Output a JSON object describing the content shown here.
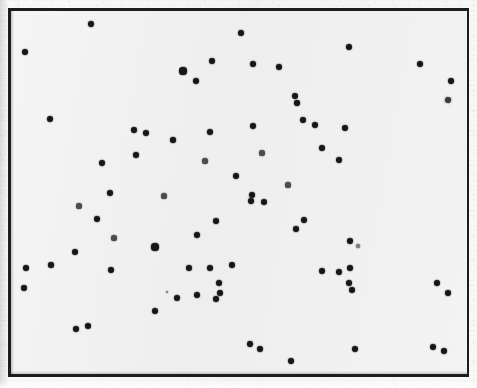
{
  "figure": {
    "kind": "scatter-plot-scan",
    "width": 477,
    "height": 388,
    "background_color": "#f2f2f2",
    "paper_color": "#f7f7f7",
    "frame": {
      "color": "#1d1d1d",
      "x": 8,
      "y": 8,
      "width": 461,
      "height": 369,
      "border_width": 2
    },
    "marker": {
      "color": "#161616",
      "shape": "circle",
      "size": 4
    }
  },
  "chart_data": {
    "type": "scatter",
    "title": "",
    "subtitle": "",
    "xlabel": "",
    "ylabel": "",
    "grid": false,
    "legend": null,
    "axis_ticks": [],
    "tick_labels": [],
    "annotations": [],
    "xlim": [
      0,
      477
    ],
    "ylim": [
      388,
      0
    ],
    "n_points": 74,
    "note": "Unlabeled scatter of dark round markers inside a rectangular frame; photocopied/scanned appearance, no axes ticks or text.",
    "series": [
      {
        "name": "points",
        "color": "#161616",
        "points": [
          {
            "x": 91,
            "y": 24,
            "r": 3.2
          },
          {
            "x": 25,
            "y": 52,
            "r": 3.0
          },
          {
            "x": 212,
            "y": 61,
            "r": 3.2
          },
          {
            "x": 241,
            "y": 33,
            "r": 3.4
          },
          {
            "x": 349,
            "y": 47,
            "r": 3.2
          },
          {
            "x": 183,
            "y": 71,
            "r": 3.6
          },
          {
            "x": 196,
            "y": 81,
            "r": 3.0
          },
          {
            "x": 253,
            "y": 64,
            "r": 3.2
          },
          {
            "x": 279,
            "y": 67,
            "r": 3.0
          },
          {
            "x": 420,
            "y": 64,
            "r": 3.2
          },
          {
            "x": 451,
            "y": 81,
            "r": 3.0
          },
          {
            "x": 295,
            "y": 96,
            "r": 3.0
          },
          {
            "x": 297,
            "y": 103,
            "r": 2.8
          },
          {
            "x": 50,
            "y": 119,
            "r": 3.2
          },
          {
            "x": 134,
            "y": 130,
            "r": 3.4
          },
          {
            "x": 146,
            "y": 133,
            "r": 3.0
          },
          {
            "x": 210,
            "y": 132,
            "r": 3.2
          },
          {
            "x": 173,
            "y": 140,
            "r": 2.8
          },
          {
            "x": 253,
            "y": 126,
            "r": 3.2
          },
          {
            "x": 303,
            "y": 120,
            "r": 3.0
          },
          {
            "x": 315,
            "y": 125,
            "r": 3.4
          },
          {
            "x": 345,
            "y": 128,
            "r": 3.2
          },
          {
            "x": 136,
            "y": 155,
            "r": 3.2
          },
          {
            "x": 322,
            "y": 148,
            "r": 3.2
          },
          {
            "x": 339,
            "y": 160,
            "r": 3.2
          },
          {
            "x": 102,
            "y": 163,
            "r": 3.2
          },
          {
            "x": 236,
            "y": 176,
            "r": 3.0
          },
          {
            "x": 110,
            "y": 193,
            "r": 3.2
          },
          {
            "x": 252,
            "y": 195,
            "r": 3.0
          },
          {
            "x": 251,
            "y": 201,
            "r": 3.0
          },
          {
            "x": 264,
            "y": 202,
            "r": 3.0
          },
          {
            "x": 216,
            "y": 221,
            "r": 3.2
          },
          {
            "x": 304,
            "y": 220,
            "r": 3.2
          },
          {
            "x": 97,
            "y": 219,
            "r": 3.2
          },
          {
            "x": 296,
            "y": 229,
            "r": 3.2
          },
          {
            "x": 197,
            "y": 235,
            "r": 3.2
          },
          {
            "x": 350,
            "y": 241,
            "r": 3.2
          },
          {
            "x": 155,
            "y": 247,
            "r": 3.6
          },
          {
            "x": 75,
            "y": 252,
            "r": 3.0
          },
          {
            "x": 51,
            "y": 265,
            "r": 2.8
          },
          {
            "x": 189,
            "y": 268,
            "r": 3.4
          },
          {
            "x": 210,
            "y": 268,
            "r": 3.2
          },
          {
            "x": 232,
            "y": 265,
            "r": 3.2
          },
          {
            "x": 322,
            "y": 271,
            "r": 3.2
          },
          {
            "x": 339,
            "y": 272,
            "r": 3.0
          },
          {
            "x": 350,
            "y": 268,
            "r": 3.0
          },
          {
            "x": 26,
            "y": 268,
            "r": 3.0
          },
          {
            "x": 219,
            "y": 283,
            "r": 3.0
          },
          {
            "x": 220,
            "y": 293,
            "r": 3.0
          },
          {
            "x": 197,
            "y": 295,
            "r": 3.0
          },
          {
            "x": 216,
            "y": 299,
            "r": 3.0
          },
          {
            "x": 349,
            "y": 283,
            "r": 3.0
          },
          {
            "x": 352,
            "y": 290,
            "r": 3.0
          },
          {
            "x": 437,
            "y": 283,
            "r": 3.0
          },
          {
            "x": 448,
            "y": 293,
            "r": 3.0
          },
          {
            "x": 24,
            "y": 288,
            "r": 3.0
          },
          {
            "x": 177,
            "y": 298,
            "r": 3.0
          },
          {
            "x": 155,
            "y": 311,
            "r": 3.0
          },
          {
            "x": 76,
            "y": 329,
            "r": 3.0
          },
          {
            "x": 88,
            "y": 326,
            "r": 3.0
          },
          {
            "x": 250,
            "y": 344,
            "r": 3.2
          },
          {
            "x": 260,
            "y": 349,
            "r": 3.0
          },
          {
            "x": 291,
            "y": 361,
            "r": 3.0
          },
          {
            "x": 355,
            "y": 349,
            "r": 3.0
          },
          {
            "x": 433,
            "y": 347,
            "r": 3.0
          },
          {
            "x": 444,
            "y": 351,
            "r": 3.0
          },
          {
            "x": 111,
            "y": 270,
            "r": 3.0
          },
          {
            "x": 262,
            "y": 153,
            "r": 2.6
          },
          {
            "x": 114,
            "y": 238,
            "r": 2.6
          },
          {
            "x": 164,
            "y": 196,
            "r": 2.6
          },
          {
            "x": 288,
            "y": 185,
            "r": 2.6
          },
          {
            "x": 205,
            "y": 161,
            "r": 2.6
          },
          {
            "x": 79,
            "y": 206,
            "r": 2.6
          }
        ]
      }
    ],
    "artifacts": [
      {
        "x": 448,
        "y": 100,
        "kind": "ink-smudge",
        "r": 3.4
      },
      {
        "x": 358,
        "y": 246,
        "kind": "faint-speck",
        "r": 1.6
      },
      {
        "x": 167,
        "y": 292,
        "kind": "faint-speck",
        "r": 1.4
      }
    ]
  }
}
